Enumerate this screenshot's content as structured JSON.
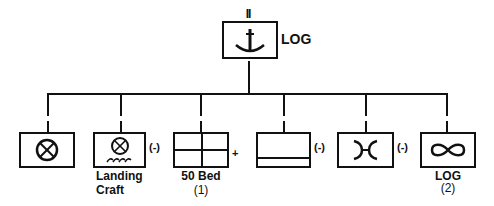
{
  "hq": {
    "echelon": "II",
    "symbol": "anchor-icon",
    "label": "LOG"
  },
  "units": [
    {
      "symbol": "wheel-icon",
      "label": "",
      "sublabel": "",
      "modifier": ""
    },
    {
      "symbol": "wheel-water-icon",
      "label": "Landing",
      "sublabel": "Craft",
      "modifier": "(-)"
    },
    {
      "symbol": "medical-cross-grid-icon",
      "label": "50 Bed",
      "sublabel": "(1)",
      "modifier": "+"
    },
    {
      "symbol": "supply-bar-icon",
      "label": "",
      "sublabel": "",
      "modifier": "(-)"
    },
    {
      "symbol": "bridge-icon",
      "label": "",
      "sublabel": "",
      "modifier": "(-)"
    },
    {
      "symbol": "infinity-icon",
      "label": "LOG",
      "sublabel": "(2)",
      "modifier": ""
    }
  ]
}
